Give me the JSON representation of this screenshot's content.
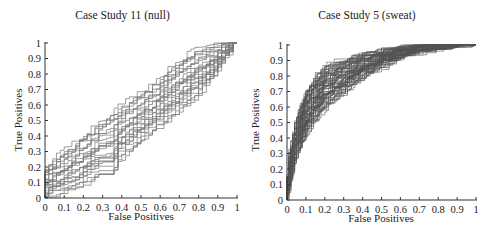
{
  "chart_data": [
    {
      "type": "line",
      "title": "Case Study 11 (null)",
      "xlabel": "False Positives",
      "ylabel": "True Positives",
      "xlim": [
        0,
        1
      ],
      "ylim": [
        0,
        1
      ],
      "xticks": [
        "0",
        "0.1",
        "0.2",
        "0.3",
        "0.4",
        "0.5",
        "0.6",
        "0.7",
        "0.8",
        "0.9",
        "1"
      ],
      "yticks": [
        "0",
        "0.1",
        "0.2",
        "0.3",
        "0.4",
        "0.5",
        "0.6",
        "0.7",
        "0.8",
        "0.9",
        "1"
      ],
      "grid": false,
      "legend": null,
      "description": "Many ROC step curves (gray) tightly clustered along the diagonal from (0,0) to (1,1), forming a dense hatched band; chance-level performance.",
      "series": [
        {
          "name": "ROC envelope upper",
          "x": [
            0,
            0.05,
            0.1,
            0.2,
            0.3,
            0.4,
            0.5,
            0.6,
            0.7,
            0.8,
            0.9,
            1
          ],
          "y": [
            0.15,
            0.22,
            0.28,
            0.38,
            0.48,
            0.58,
            0.66,
            0.75,
            0.86,
            0.95,
            0.98,
            1
          ]
        },
        {
          "name": "ROC median",
          "x": [
            0,
            0.1,
            0.2,
            0.3,
            0.4,
            0.5,
            0.6,
            0.7,
            0.8,
            0.9,
            1
          ],
          "y": [
            0,
            0.15,
            0.25,
            0.35,
            0.45,
            0.55,
            0.63,
            0.72,
            0.82,
            0.92,
            1
          ]
        },
        {
          "name": "ROC envelope lower",
          "x": [
            0,
            0.1,
            0.2,
            0.3,
            0.36,
            0.4,
            0.5,
            0.6,
            0.7,
            0.8,
            0.9,
            1
          ],
          "y": [
            0,
            0.03,
            0.08,
            0.15,
            0.09,
            0.25,
            0.35,
            0.45,
            0.55,
            0.65,
            0.8,
            1
          ]
        }
      ]
    },
    {
      "type": "line",
      "title": "Case Study 5 (sweat)",
      "xlabel": "False Positives",
      "ylabel": "True Positives",
      "xlim": [
        0,
        1
      ],
      "ylim": [
        0,
        1
      ],
      "xticks": [
        "0",
        "0.1",
        "0.2",
        "0.3",
        "0.4",
        "0.5",
        "0.6",
        "0.7",
        "0.8",
        "0.9",
        "1"
      ],
      "yticks": [
        "0",
        "0.1",
        "0.2",
        "0.3",
        "0.4",
        "0.5",
        "0.6",
        "0.7",
        "0.8",
        "0.9",
        "1"
      ],
      "grid": false,
      "legend": null,
      "description": "Many ROC step curves (dark gray) concave above the diagonal, rising steeply near the origin and saturating near TP=1; good discriminative performance.",
      "series": [
        {
          "name": "ROC envelope upper",
          "x": [
            0,
            0.02,
            0.05,
            0.1,
            0.15,
            0.2,
            0.3,
            0.4,
            0.5,
            0.6,
            0.7,
            0.8,
            0.9,
            1
          ],
          "y": [
            0,
            0.3,
            0.5,
            0.68,
            0.78,
            0.85,
            0.9,
            0.93,
            0.95,
            0.97,
            0.98,
            0.99,
            1,
            1
          ]
        },
        {
          "name": "ROC median",
          "x": [
            0,
            0.02,
            0.05,
            0.1,
            0.15,
            0.2,
            0.3,
            0.4,
            0.5,
            0.6,
            0.7,
            0.8,
            0.9,
            1
          ],
          "y": [
            0,
            0.2,
            0.38,
            0.55,
            0.65,
            0.72,
            0.8,
            0.86,
            0.9,
            0.93,
            0.95,
            0.97,
            0.99,
            1
          ]
        },
        {
          "name": "ROC envelope lower",
          "x": [
            0,
            0.02,
            0.05,
            0.1,
            0.15,
            0.2,
            0.3,
            0.4,
            0.5,
            0.6,
            0.7,
            0.8,
            0.9,
            1
          ],
          "y": [
            0,
            0.08,
            0.25,
            0.4,
            0.5,
            0.58,
            0.68,
            0.78,
            0.85,
            0.9,
            0.94,
            0.96,
            0.98,
            1
          ]
        }
      ]
    }
  ],
  "left": {
    "title": "Case Study 11 (null)",
    "xlabel": "False Positives",
    "ylabel": "True Positives"
  },
  "right": {
    "title": "Case Study 5 (sweat)",
    "xlabel": "False Positives",
    "ylabel": "True Positives"
  },
  "colors": {
    "left_curves": "#7a7a7a",
    "right_curves": "#555555",
    "axis": "#333333"
  }
}
